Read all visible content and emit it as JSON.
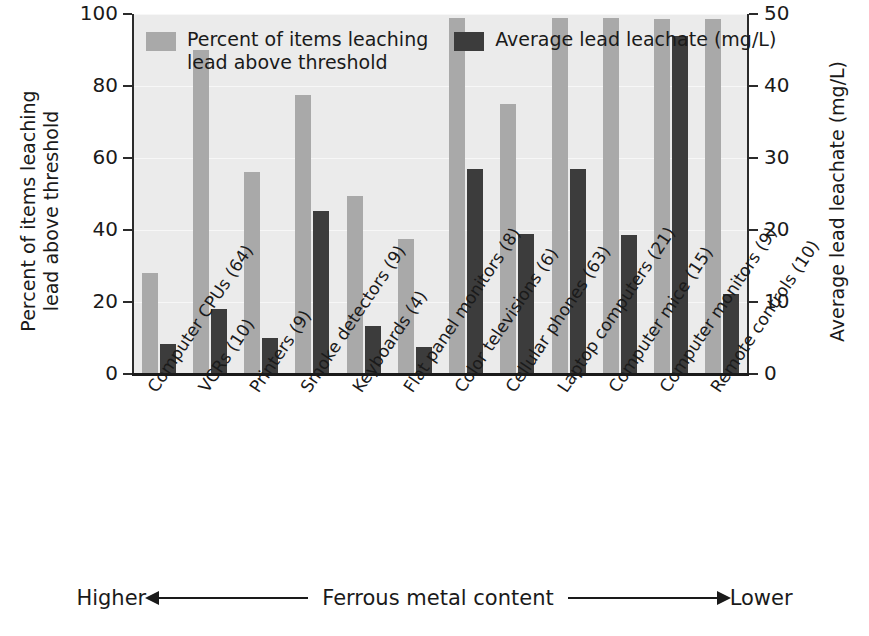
{
  "chart_data": {
    "type": "bar",
    "title": "",
    "categories": [
      "Computer CPUs (64)",
      "VCRs (10)",
      "Printers (9)",
      "Smoke detectors (9)",
      "Keyboards (4)",
      "Flat panel monitors (8)",
      "Color televisions (6)",
      "Cellular phones (63)",
      "Laptop computers (21)",
      "Computer mice (15)",
      "Computer monitors (9)",
      "Remote controls (10)"
    ],
    "series": [
      {
        "name": "Percent of items leaching lead above threshold",
        "axis": "left",
        "color": "#a9a9a9",
        "values": [
          28,
          90,
          56,
          77.5,
          49.5,
          37.5,
          99,
          75,
          99,
          99,
          98.5,
          98.5
        ]
      },
      {
        "name": "Average lead leachate (mg/L)",
        "axis": "right",
        "color": "#3c3c3c",
        "values": [
          4.2,
          9.0,
          5.0,
          22.7,
          6.7,
          3.8,
          28.5,
          19.5,
          28.5,
          19.3,
          47.0,
          11.1
        ]
      }
    ],
    "xlabel": "Ferrous metal content",
    "ylabel_left": "Percent of items leaching\nlead above threshold",
    "ylabel_right": "Average lead leachate (mg/L)",
    "ylim_left": [
      0,
      100
    ],
    "ylim_right": [
      0,
      50
    ],
    "yticks_left": [
      "0",
      "20",
      "40",
      "60",
      "80",
      "100"
    ],
    "yticks_right": [
      "0",
      "10",
      "20",
      "30",
      "40",
      "50"
    ],
    "grid": true,
    "legend_position": "upper-left-inside"
  },
  "legend": {
    "entries": [
      {
        "label": "Percent of items leaching lead above threshold",
        "swatch": "light"
      },
      {
        "label": "Average lead leachate (mg/L)",
        "swatch": "dark"
      }
    ]
  },
  "axes": {
    "left_title_line1": "Percent of items leaching",
    "left_title_line2": "lead above threshold",
    "right_title": "Average lead leachate (mg/L)"
  },
  "footer": {
    "left_label": "Higher",
    "center_label": "Ferrous metal content",
    "right_label": "Lower"
  },
  "colors": {
    "light_bar": "#a9a9a9",
    "dark_bar": "#3c3c3c",
    "plot_background": "#ebebeb",
    "axis": "#1a1a1a"
  }
}
